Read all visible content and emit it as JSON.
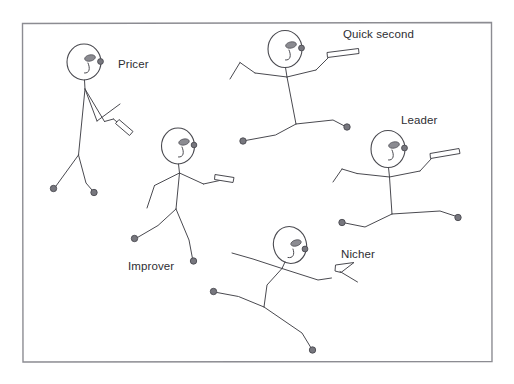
{
  "diagram": {
    "title": "",
    "background_color": "#ffffff",
    "frame": {
      "x": 22,
      "y": 22,
      "width": 470,
      "height": 340,
      "stroke_color": "#8c8c92"
    },
    "line_color": "#4a4a50",
    "joint_color": "#77777e",
    "figures": [
      {
        "id": "pricer",
        "label": "Pricer",
        "label_x": 118,
        "label_y": 68,
        "head_cx": 84,
        "head_cy": 62,
        "holds_tool": true,
        "pose": "standing, arms folded forward holding a bar"
      },
      {
        "id": "quick-second",
        "label": "Quick second",
        "label_x": 343,
        "label_y": 38,
        "head_cx": 285,
        "head_cy": 49,
        "holds_tool": true,
        "pose": "arms spread wide, right arm raised holding a bar, legs striding"
      },
      {
        "id": "improver",
        "label": "Improver",
        "label_x": 128,
        "label_y": 270,
        "head_cx": 178,
        "head_cy": 146,
        "holds_tool": true,
        "pose": "walking, right arm extended holding a bar"
      },
      {
        "id": "leader",
        "label": "Leader",
        "label_x": 401,
        "label_y": 124,
        "head_cx": 388,
        "head_cy": 149,
        "holds_tool": true,
        "pose": "arms spread, right arm raised holding a bar, legs striding"
      },
      {
        "id": "nicher",
        "label": "Nicher",
        "label_x": 341,
        "label_y": 258,
        "head_cx": 290,
        "head_cy": 245,
        "holds_tool": true,
        "pose": "leaning, arms spread, right arm holding a bar"
      }
    ]
  }
}
